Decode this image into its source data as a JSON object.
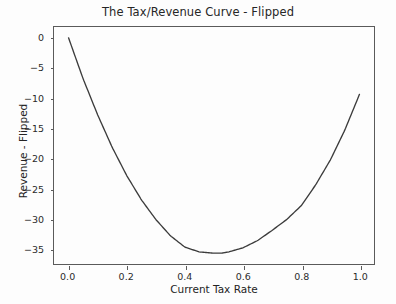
{
  "chart_data": {
    "type": "line",
    "title": "The Tax/Revenue Curve - Flipped",
    "xlabel": "Current Tax Rate",
    "ylabel": "Revenue - Flipped",
    "xlim": [
      -0.05,
      1.05
    ],
    "ylim": [
      -37.6,
      1.8
    ],
    "grid": false,
    "legend": null,
    "line_color": "#3c3c3c",
    "series": [
      {
        "name": "Revenue - Flipped",
        "x": [
          0.0,
          0.05,
          0.1,
          0.15,
          0.2,
          0.25,
          0.3,
          0.35,
          0.4,
          0.45,
          0.5,
          0.525,
          0.55,
          0.6,
          0.65,
          0.7,
          0.75,
          0.8,
          0.85,
          0.9,
          0.95,
          1.0
        ],
        "y": [
          0.0,
          -6.8,
          -12.8,
          -18.2,
          -22.9,
          -26.9,
          -30.2,
          -32.9,
          -34.8,
          -35.6,
          -35.8,
          -35.8,
          -35.6,
          -34.9,
          -33.7,
          -32.0,
          -30.2,
          -27.9,
          -24.4,
          -20.3,
          -15.3,
          -9.4
        ]
      }
    ],
    "xticks": [
      {
        "value": 0.0,
        "label": "0.0"
      },
      {
        "value": 0.2,
        "label": "0.2"
      },
      {
        "value": 0.4,
        "label": "0.4"
      },
      {
        "value": 0.6,
        "label": "0.6"
      },
      {
        "value": 0.8,
        "label": "0.8"
      },
      {
        "value": 1.0,
        "label": "1.0"
      }
    ],
    "yticks": [
      {
        "value": 0,
        "label": "0"
      },
      {
        "value": -5,
        "label": "−5"
      },
      {
        "value": -10,
        "label": "−10"
      },
      {
        "value": -15,
        "label": "−15"
      },
      {
        "value": -20,
        "label": "−20"
      },
      {
        "value": -25,
        "label": "−25"
      },
      {
        "value": -30,
        "label": "−30"
      },
      {
        "value": -35,
        "label": "−35"
      }
    ]
  },
  "figure": {
    "title": "The Tax/Revenue Curve - Flipped",
    "xlabel": "Current Tax Rate",
    "ylabel": "Revenue - Flipped"
  }
}
